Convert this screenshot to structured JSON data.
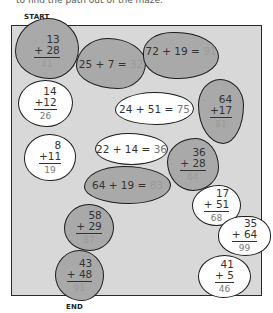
{
  "instructions": "to find the path out of the maze.",
  "labels": {
    "start": "START",
    "end": "END"
  },
  "colors": {
    "path_stone": "#a9a9a9",
    "other_stone": "#ffffff",
    "background": "#d8d8d8",
    "outline": "#1d1d1d"
  },
  "stones": [
    {
      "id": 1,
      "type": "vertical",
      "shade": "gray",
      "a": "13",
      "b": "+ 28",
      "answer": "41"
    },
    {
      "id": 2,
      "type": "horizontal",
      "shade": "gray",
      "expr": "25 + 7 =",
      "answer": "32"
    },
    {
      "id": 3,
      "type": "horizontal",
      "shade": "gray",
      "expr": "72 + 19 =",
      "answer": "91"
    },
    {
      "id": 4,
      "type": "vertical",
      "shade": "white",
      "a": "14",
      "b": "+12",
      "answer": "26"
    },
    {
      "id": 5,
      "type": "vertical",
      "shade": "gray",
      "a": "64",
      "b": "+17",
      "answer": "81"
    },
    {
      "id": 6,
      "type": "horizontal",
      "shade": "white",
      "expr": "24 + 51 =",
      "answer": "75"
    },
    {
      "id": 7,
      "type": "vertical",
      "shade": "white",
      "a": "8",
      "b": "+11",
      "answer": "19"
    },
    {
      "id": 8,
      "type": "horizontal",
      "shade": "white",
      "expr": "22 + 14 =",
      "answer": "36"
    },
    {
      "id": 9,
      "type": "vertical",
      "shade": "gray",
      "a": "36",
      "b": "+ 28",
      "answer": "64"
    },
    {
      "id": 10,
      "type": "horizontal",
      "shade": "gray",
      "expr": "64 + 19 =",
      "answer": "83"
    },
    {
      "id": 11,
      "type": "vertical",
      "shade": "white",
      "a": "17",
      "b": "+ 51",
      "answer": "68"
    },
    {
      "id": 12,
      "type": "vertical",
      "shade": "white",
      "a": "35",
      "b": "+ 64",
      "answer": "99"
    },
    {
      "id": 13,
      "type": "vertical",
      "shade": "gray",
      "a": "58",
      "b": "+ 29",
      "answer": "87"
    },
    {
      "id": 14,
      "type": "vertical",
      "shade": "white",
      "a": "41",
      "b": "+ 5",
      "answer": "46"
    },
    {
      "id": 15,
      "type": "vertical",
      "shade": "gray",
      "a": "43",
      "b": "+ 48",
      "answer": "91"
    }
  ]
}
